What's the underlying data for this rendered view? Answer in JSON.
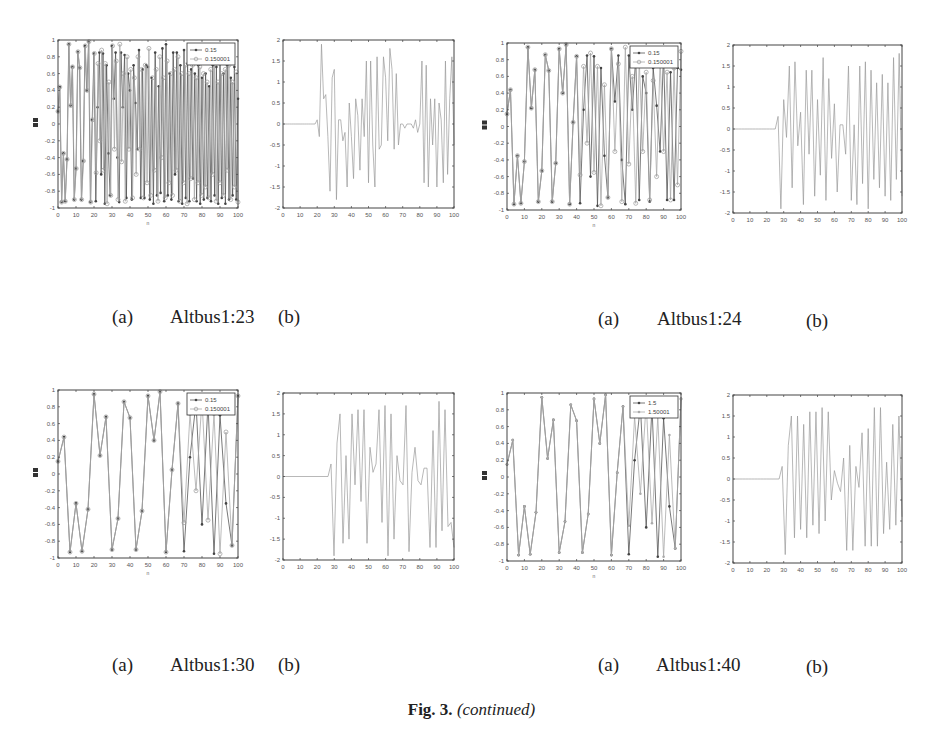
{
  "figure": {
    "label": "Fig. 3.",
    "caption_suffix": "(continued)"
  },
  "panels": [
    {
      "name": "Altbus1:23",
      "caption_a": "(a)",
      "caption_b": "(b)",
      "legend": [
        "0.15",
        "0.150001"
      ],
      "xlabel": "n"
    },
    {
      "name": "Altbus1:24",
      "caption_a": "(a)",
      "caption_b": "(b)",
      "legend": [
        "0.15",
        "0.150001"
      ],
      "xlabel": "n"
    },
    {
      "name": "Altbus1:30",
      "caption_a": "(a)",
      "caption_b": "(b)",
      "legend": [
        "0.15",
        "0.150001"
      ],
      "xlabel": "n"
    },
    {
      "name": "Altbus1:40",
      "caption_a": "(a)",
      "caption_b": "(b)",
      "legend": [
        "1.5",
        "1.50001"
      ],
      "xlabel": "n"
    }
  ],
  "chart_data": [
    {
      "id": "altbus1-23-a",
      "type": "line",
      "title": "",
      "xlabel": "n",
      "ylabel": "",
      "xlim": [
        0,
        100
      ],
      "ylim": [
        -1,
        1
      ],
      "xticks": [
        "0",
        "10",
        "20",
        "30",
        "40",
        "50",
        "60",
        "70",
        "80",
        "90",
        "100"
      ],
      "yticks": [
        "-1",
        "-0.8",
        "-0.6",
        "-0.4",
        "-0.2",
        "0",
        "0.2",
        "0.4",
        "0.6",
        "0.8",
        "1"
      ],
      "legend_position": "upper right",
      "series": [
        {
          "name": "0.15",
          "marker": "dot",
          "values": [
            0.15,
            0.44,
            -0.93,
            -0.35,
            -0.92,
            -0.42,
            0.95,
            0.22,
            0.68,
            -0.9,
            -0.53,
            0.86,
            0.67,
            -0.9,
            -0.44,
            0.93,
            0.4,
            0.98,
            -0.93,
            0.05,
            0.84,
            -0.92,
            0.2,
            0.85,
            -0.6,
            0.84,
            -0.95,
            0.7,
            -0.35,
            -0.85,
            0.93,
            0.3,
            0.85,
            -0.4,
            -0.93,
            0.85,
            0.2,
            0.82,
            -0.88,
            0.6,
            0.4,
            -0.9,
            0.7,
            0.25,
            -0.3,
            0.88,
            -0.88,
            0.65,
            -0.88,
            0.7,
            0.68,
            -0.9,
            0.55,
            -0.95,
            0.85,
            -0.85,
            0.45,
            -0.82,
            0.9,
            -0.92,
            0.95,
            -0.85,
            0.6,
            -0.9,
            0.85,
            -0.6,
            0.85,
            -0.92,
            0.7,
            -0.95,
            0.88,
            -0.88,
            0.72,
            -0.92,
            0.65,
            -0.65,
            0.6,
            -0.92,
            0.7,
            -0.95,
            0.55,
            -0.9,
            0.6,
            -0.88,
            0.45,
            -0.92,
            0.7,
            -0.85,
            0.68,
            -0.95,
            0.72,
            -0.88,
            0.6,
            -0.95,
            0.7,
            -0.9,
            0.55,
            -0.85,
            0.68,
            -0.9,
            0.3
          ]
        },
        {
          "name": "0.150001",
          "marker": "circle",
          "values": [
            0.15,
            0.44,
            -0.93,
            -0.35,
            -0.92,
            -0.42,
            0.95,
            0.22,
            0.68,
            -0.9,
            -0.53,
            0.86,
            0.67,
            -0.9,
            -0.44,
            0.93,
            0.4,
            0.98,
            -0.93,
            0.05,
            0.84,
            -0.58,
            0.72,
            -0.2,
            0.88,
            -0.55,
            0.72,
            -0.95,
            0.5,
            -0.85,
            0.93,
            -0.3,
            0.75,
            -0.9,
            0.95,
            -0.45,
            0.6,
            -0.92,
            0.8,
            -0.3,
            0.65,
            -0.88,
            0.55,
            -0.6,
            0.8,
            -0.3,
            0.65,
            -0.88,
            0.7,
            -0.7,
            0.9,
            -0.85,
            0.55,
            -0.55,
            0.65,
            -0.92,
            0.8,
            -0.4,
            0.55,
            -0.88,
            0.75,
            -0.7,
            0.6,
            -0.85,
            0.65,
            -0.55,
            0.8,
            -0.92,
            0.6,
            -0.7,
            0.7,
            -0.95,
            0.6,
            -0.65,
            0.7,
            -0.9,
            0.55,
            -0.7,
            0.68,
            -0.85,
            0.6,
            -0.75,
            0.5,
            -0.88,
            0.65,
            -0.6,
            0.75,
            -0.92,
            0.5,
            -0.7,
            0.6,
            -0.85,
            0.65,
            -0.55,
            0.7,
            -0.9,
            0.5,
            -0.75,
            0.62,
            -0.93
          ]
        }
      ]
    },
    {
      "id": "altbus1-23-b",
      "type": "line",
      "title": "",
      "xlabel": "",
      "ylabel": "",
      "xlim": [
        0,
        100
      ],
      "ylim": [
        -2,
        2
      ],
      "xticks": [
        "0",
        "10",
        "20",
        "30",
        "40",
        "50",
        "60",
        "70",
        "80",
        "90",
        "100"
      ],
      "yticks": [
        "-2",
        "-1.5",
        "-1",
        "-0.5",
        "0",
        "0.5",
        "1",
        "1.5",
        "2"
      ],
      "series": [
        {
          "name": "difference",
          "values": [
            0,
            0,
            0,
            0,
            0,
            0,
            0,
            0,
            0,
            0,
            0,
            0,
            0,
            0,
            0,
            0,
            0.1,
            -0.3,
            1.9,
            0.6,
            0.7,
            -0.3,
            -1.6,
            1.1,
            1.3,
            -1.8,
            0.1,
            0.1,
            -0.4,
            -0.2,
            -1.5,
            0.5,
            -0.3,
            -1.3,
            0.6,
            0.2,
            -1.1,
            0.6,
            -0.3,
            1.5,
            -1.4,
            1.5,
            -0.5,
            -1.5,
            1.6,
            -0.6,
            -0.5,
            1.6,
            1.1,
            -0.4,
            1.8,
            1.3,
            -0.6,
            1.2,
            -0.5,
            0,
            0,
            -0.1,
            0,
            0,
            0,
            -0.1,
            0.1,
            -0.2,
            0,
            1.5,
            -1.4,
            1.4,
            -1.5,
            0.6,
            -0.5,
            0.6,
            -1.5,
            0.5,
            0.1,
            -1.4,
            1.5,
            -1.2,
            0.6,
            1.6,
            -0.5
          ]
        }
      ]
    },
    {
      "id": "altbus1-24-a",
      "type": "line",
      "title": "",
      "xlabel": "n",
      "ylabel": "",
      "xlim": [
        0,
        100
      ],
      "ylim": [
        -1,
        1
      ],
      "xticks": [
        "0",
        "10",
        "20",
        "30",
        "40",
        "50",
        "60",
        "70",
        "80",
        "90",
        "100"
      ],
      "yticks": [
        "-1",
        "-0.8",
        "-0.6",
        "-0.4",
        "-0.2",
        "0",
        "0.2",
        "0.4",
        "0.6",
        "0.8",
        "1"
      ],
      "legend_position": "upper right",
      "series": [
        {
          "name": "0.15",
          "marker": "dot",
          "values": [
            0.15,
            0.44,
            -0.93,
            -0.35,
            -0.92,
            -0.42,
            0.95,
            0.22,
            0.68,
            -0.9,
            -0.53,
            0.86,
            0.67,
            -0.9,
            -0.44,
            0.93,
            0.4,
            0.98,
            -0.93,
            0.05,
            0.84,
            -0.92,
            0.2,
            0.85,
            -0.6,
            0.84,
            -0.95,
            0.7,
            -0.35,
            -0.85,
            0.93,
            0.3,
            0.85,
            -0.4,
            -0.93,
            0.85,
            0.2,
            0.82,
            -0.88,
            0.6,
            0.4,
            -0.9,
            0.7,
            0.25,
            -0.3,
            0.88,
            -0.88,
            0.65,
            -0.88,
            0.7,
            0.68
          ]
        },
        {
          "name": "0.150001",
          "marker": "circle",
          "values": [
            0.15,
            0.44,
            -0.93,
            -0.35,
            -0.92,
            -0.42,
            0.95,
            0.22,
            0.68,
            -0.9,
            -0.53,
            0.86,
            0.67,
            -0.9,
            -0.44,
            0.93,
            0.4,
            0.98,
            -0.93,
            0.05,
            0.84,
            -0.58,
            0.72,
            -0.2,
            0.88,
            -0.55,
            0.72,
            -0.95,
            0.5,
            -0.85,
            0.93,
            -0.3,
            0.75,
            -0.9,
            0.95,
            -0.45,
            0.6,
            -0.92,
            0.8,
            -0.3,
            0.65,
            -0.88,
            0.55,
            -0.6,
            0.8,
            -0.3,
            0.65,
            -0.88,
            0.7,
            -0.7,
            0.9
          ]
        }
      ]
    },
    {
      "id": "altbus1-24-b",
      "type": "line",
      "title": "",
      "xlabel": "",
      "ylabel": "",
      "xlim": [
        0,
        100
      ],
      "ylim": [
        -2,
        2
      ],
      "xticks": [
        "0",
        "10",
        "20",
        "30",
        "40",
        "50",
        "60",
        "70",
        "80",
        "90",
        "100"
      ],
      "yticks": [
        "-2",
        "-1.5",
        "-1",
        "-0.5",
        "0",
        "0.5",
        "1",
        "1.5",
        "2"
      ],
      "series": [
        {
          "name": "difference",
          "values": [
            0,
            0,
            0,
            0,
            0,
            0,
            0,
            0,
            0,
            0,
            0,
            0,
            0,
            0,
            0,
            0,
            0.3,
            -1.9,
            0.7,
            -0.2,
            1.5,
            -1.4,
            1.6,
            -0.4,
            0.4,
            -1.8,
            1.4,
            -0.6,
            1.4,
            -1.6,
            0.7,
            -1.1,
            1.7,
            -1.7,
            1.2,
            -0.7,
            0.6,
            -1.5,
            0.1,
            0.1,
            -0.6,
            1.5,
            -1.7,
            0.1,
            -1.8,
            1.5,
            -1.3,
            1.6,
            -1.9,
            1.4,
            -1.2,
            1.1,
            -1.4,
            1.3,
            -1.6,
            1.1,
            -1.7,
            1.7,
            -1.2,
            1.8,
            -1.6
          ]
        }
      ]
    },
    {
      "id": "altbus1-30-a",
      "type": "line",
      "title": "",
      "xlabel": "n",
      "ylabel": "",
      "xlim": [
        0,
        100
      ],
      "ylim": [
        -1,
        1
      ],
      "xticks": [
        "0",
        "10",
        "20",
        "30",
        "40",
        "50",
        "60",
        "70",
        "80",
        "90",
        "100"
      ],
      "yticks": [
        "-1",
        "-0.8",
        "-0.6",
        "-0.4",
        "-0.2",
        "0",
        "0.2",
        "0.4",
        "0.6",
        "0.8",
        "1"
      ],
      "legend_position": "upper right",
      "series": [
        {
          "name": "0.15",
          "marker": "dot",
          "values": [
            0.15,
            0.44,
            -0.93,
            -0.35,
            -0.92,
            -0.42,
            0.95,
            0.22,
            0.68,
            -0.9,
            -0.53,
            0.86,
            0.67,
            -0.9,
            -0.44,
            0.93,
            0.4,
            0.98,
            -0.93,
            0.05,
            0.84,
            -0.92,
            0.2,
            0.85,
            -0.6,
            0.84,
            -0.95,
            0.7,
            -0.35,
            -0.85,
            0.93
          ]
        },
        {
          "name": "0.150001",
          "marker": "circle",
          "values": [
            0.15,
            0.44,
            -0.93,
            -0.35,
            -0.92,
            -0.42,
            0.95,
            0.22,
            0.68,
            -0.9,
            -0.53,
            0.86,
            0.67,
            -0.9,
            -0.44,
            0.93,
            0.4,
            0.98,
            -0.93,
            0.05,
            0.84,
            -0.58,
            0.72,
            -0.2,
            0.88,
            -0.55,
            0.72,
            -0.95,
            0.5,
            -0.85,
            0.93
          ]
        }
      ]
    },
    {
      "id": "altbus1-30-b",
      "type": "line",
      "title": "",
      "xlabel": "",
      "ylabel": "",
      "xlim": [
        0,
        100
      ],
      "ylim": [
        -2,
        2
      ],
      "xticks": [
        "0",
        "10",
        "20",
        "30",
        "40",
        "50",
        "60",
        "70",
        "80",
        "90",
        "100"
      ],
      "yticks": [
        "-2",
        "-1.5",
        "-1",
        "-0.5",
        "0",
        "0.5",
        "1",
        "1.5",
        "2"
      ],
      "series": [
        {
          "name": "difference",
          "values": [
            0,
            0,
            0,
            0,
            0,
            0,
            0,
            0,
            0,
            0,
            0,
            0,
            0,
            0,
            0,
            0,
            0.3,
            -1.9,
            0.8,
            1.5,
            -1.6,
            0.5,
            -1.5,
            1.5,
            -0.2,
            1.6,
            -0.6,
            1.6,
            -1.6,
            0.7,
            0.1,
            0.3,
            1.6,
            -1.1,
            1.7,
            -1.9,
            1.5,
            -1.5,
            0.5,
            -0.1,
            -0.2,
            1.7,
            -1.8,
            0.1,
            0.7,
            -0.1,
            -0.2,
            0.2,
            0.2,
            -1.7,
            1.1,
            -1.7,
            1.8,
            -1.3,
            1.6,
            -1.2,
            -1.1,
            -1.7
          ]
        }
      ]
    },
    {
      "id": "altbus1-40-a",
      "type": "line",
      "title": "",
      "xlabel": "n",
      "ylabel": "",
      "xlim": [
        0,
        100
      ],
      "ylim": [
        -1,
        1
      ],
      "xticks": [
        "0",
        "10",
        "20",
        "30",
        "40",
        "50",
        "60",
        "70",
        "80",
        "90",
        "100"
      ],
      "yticks": [
        "-1",
        "-0.8",
        "-0.6",
        "-0.4",
        "-0.2",
        "0",
        "0.2",
        "0.4",
        "0.6",
        "0.8",
        "1"
      ],
      "legend_position": "upper right",
      "series": [
        {
          "name": "1.5",
          "marker": "dot",
          "values": [
            0.15,
            0.44,
            -0.93,
            -0.35,
            -0.92,
            -0.42,
            0.95,
            0.22,
            0.68,
            -0.9,
            -0.53,
            0.86,
            0.67,
            -0.9,
            -0.44,
            0.93,
            0.4,
            0.98,
            -0.93,
            0.05,
            0.84,
            -0.92,
            0.2,
            0.85,
            -0.6,
            0.84,
            -0.95,
            0.7,
            -0.35,
            -0.85,
            0.93
          ]
        },
        {
          "name": "1.50001",
          "marker": "dot-light",
          "values": [
            0.15,
            0.44,
            -0.93,
            -0.35,
            -0.92,
            -0.42,
            0.95,
            0.22,
            0.68,
            -0.9,
            -0.53,
            0.86,
            0.67,
            -0.9,
            -0.44,
            0.93,
            0.4,
            0.98,
            -0.93,
            0.05,
            0.84,
            -0.58,
            0.72,
            -0.2,
            0.88,
            -0.55,
            0.72,
            -0.95,
            0.5,
            -0.85,
            0.93
          ]
        }
      ]
    },
    {
      "id": "altbus1-40-b",
      "type": "line",
      "title": "",
      "xlabel": "",
      "ylabel": "",
      "xlim": [
        0,
        100
      ],
      "ylim": [
        -2,
        2
      ],
      "xticks": [
        "0",
        "10",
        "20",
        "30",
        "40",
        "50",
        "60",
        "70",
        "80",
        "90",
        "100"
      ],
      "yticks": [
        "-2",
        "-1.5",
        "-1",
        "-0.5",
        "0",
        "0.5",
        "1",
        "1.5",
        "2"
      ],
      "series": [
        {
          "name": "difference",
          "values": [
            0,
            0,
            0,
            0,
            0,
            0,
            0,
            0,
            0,
            0,
            0,
            0,
            0,
            0,
            0,
            0,
            0.3,
            -1.8,
            0.8,
            1.5,
            -1.4,
            1.5,
            -1.2,
            1.3,
            -1.4,
            1.6,
            -1.1,
            1.6,
            -1.3,
            1.7,
            -1.0,
            1.6,
            -0.5,
            0.2,
            -0.1,
            -0.3,
            0.5,
            -1.7,
            0.8,
            -1.7,
            0.3,
            -0.2,
            1.1,
            -1.6,
            1.2,
            -1.6,
            1.7,
            -1.6,
            1.7,
            -1.3,
            0.4,
            -1.2,
            1.3,
            -1.1,
            1.5,
            -0.9
          ]
        }
      ]
    }
  ]
}
